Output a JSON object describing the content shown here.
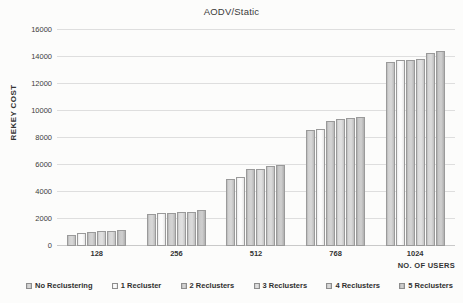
{
  "chart_data": {
    "type": "bar",
    "title": "AODV/Static",
    "xlabel": "NO. OF USERS",
    "ylabel": "REKEY COST",
    "categories": [
      "128",
      "256",
      "512",
      "768",
      "1024"
    ],
    "ylim": [
      0,
      16000
    ],
    "yticks": [
      0,
      2000,
      4000,
      6000,
      8000,
      10000,
      12000,
      14000,
      16000
    ],
    "grid": true,
    "legend_position": "bottom",
    "series": [
      {
        "name": "No Reclustering",
        "values": [
          850,
          2400,
          4980,
          8560,
          13620
        ]
      },
      {
        "name": "1 Recluster",
        "values": [
          960,
          2410,
          5130,
          8640,
          13760
        ]
      },
      {
        "name": "2 Reclusters",
        "values": [
          1040,
          2460,
          5680,
          9260,
          13760
        ]
      },
      {
        "name": "3 Reclusters",
        "values": [
          1080,
          2520,
          5720,
          9420,
          13880
        ]
      },
      {
        "name": "4 Reclusters",
        "values": [
          1110,
          2540,
          5900,
          9450,
          14320
        ]
      },
      {
        "name": "5 Reclusters",
        "values": [
          1160,
          2640,
          6020,
          9550,
          14460
        ]
      }
    ]
  },
  "colors": {
    "gridline": "#dedede",
    "axis": "#c9c9c9",
    "text": "#2b2b2b",
    "background": "#fcfcfb"
  }
}
